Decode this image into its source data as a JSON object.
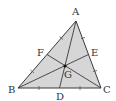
{
  "diagram": {
    "colors": {
      "fill": "#d6d6d6",
      "stroke": "#3a3a3a",
      "label": "#333333",
      "background": "#ffffff"
    },
    "points": {
      "A": {
        "label": "A",
        "x": 76,
        "y": 21
      },
      "B": {
        "label": "B",
        "x": 18,
        "y": 88
      },
      "C": {
        "label": "C",
        "x": 101,
        "y": 88
      },
      "D": {
        "label": "D",
        "x": 59.5,
        "y": 88
      },
      "E": {
        "label": "E",
        "x": 88.5,
        "y": 54.5
      },
      "F": {
        "label": "F",
        "x": 47,
        "y": 54.5
      },
      "G": {
        "label": "G",
        "x": 65,
        "y": 66
      }
    },
    "medians": [
      "AD",
      "BE",
      "CF"
    ],
    "tick_marks": "equal-segment ticks on BD, DC, CE, EA, AF, FB"
  }
}
